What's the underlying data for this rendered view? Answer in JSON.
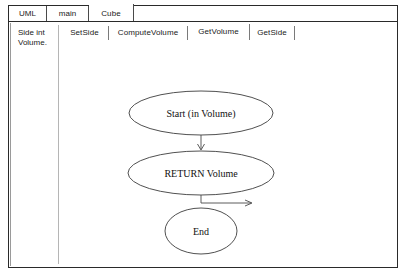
{
  "window": {
    "title": "UML Class Editor"
  },
  "outer_tabs": [
    {
      "label": "UML",
      "selected": false
    },
    {
      "label": "main",
      "selected": false
    },
    {
      "label": "Cube",
      "selected": true
    }
  ],
  "attribute_pane": {
    "items": [
      {
        "label": "Side int"
      },
      {
        "label": "Volume."
      }
    ]
  },
  "method_tabs": [
    {
      "label": "SetSide",
      "selected": false
    },
    {
      "label": "ComputeVolume",
      "selected": false
    },
    {
      "label": "GetVolume",
      "selected": true
    },
    {
      "label": "GetSide",
      "selected": false
    }
  ],
  "diagram": {
    "type": "activity-diagram",
    "nodes": [
      {
        "id": "start",
        "shape": "ellipse",
        "label": "Start (in Volume)"
      },
      {
        "id": "return",
        "shape": "ellipse",
        "label": "RETURN Volume"
      },
      {
        "id": "end",
        "shape": "ellipse",
        "label": "End"
      }
    ],
    "edges": [
      {
        "from": "start",
        "to": "return",
        "style": "vertical-arrow"
      },
      {
        "from": "return",
        "to": "right",
        "style": "elbow-arrow-right"
      }
    ]
  },
  "colors": {
    "background": "#ffffff",
    "border": "#2a2a2a",
    "stroke": "#3c3c3c",
    "text": "#1a1a1a"
  }
}
